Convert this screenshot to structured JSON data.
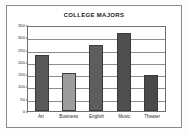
{
  "chart_data": {
    "type": "bar",
    "title": "COLLEGE MAJORS",
    "categories": [
      "Art",
      "Business",
      "English",
      "Music",
      "Theater"
    ],
    "values": [
      228,
      155,
      268,
      318,
      145
    ],
    "xlabel": "",
    "ylabel": "",
    "ylim": [
      0,
      350
    ],
    "ytick_labels": [
      "350",
      "300",
      "250",
      "200",
      "150",
      "100",
      "50",
      "0"
    ],
    "ytick_values": [
      350,
      300,
      250,
      200,
      150,
      100,
      50,
      0
    ],
    "grid": true,
    "legend": false,
    "bar_colors": [
      "#595959",
      "#9d9d9d",
      "#5e5e5e",
      "#4f4f4f",
      "#4a4a4a"
    ],
    "bar_border_color": "#3a3a3a",
    "plot_background": "#ffffff",
    "gridline_color": "#8d8d8d",
    "frame_color": "#8a8a8a"
  }
}
